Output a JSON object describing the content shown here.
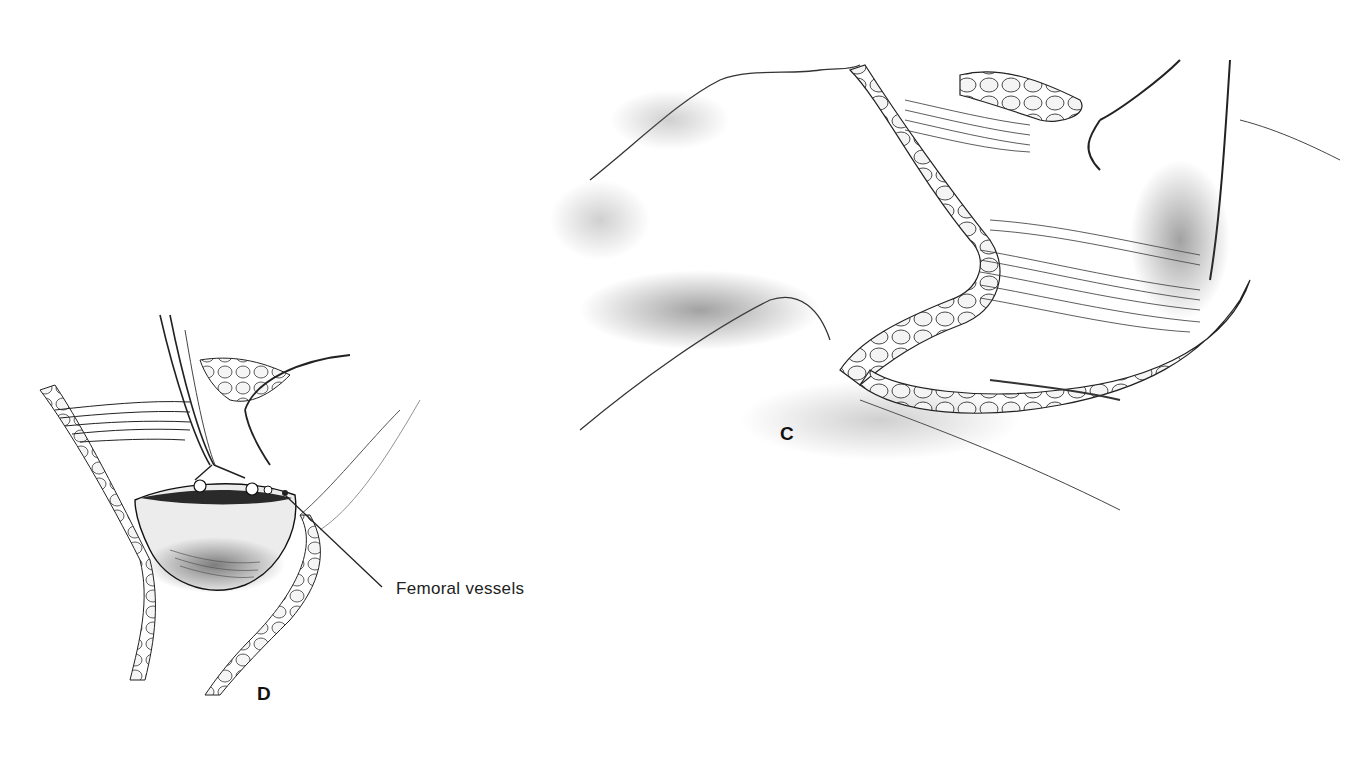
{
  "figure": {
    "panels": [
      {
        "id": "C",
        "label": "C",
        "description": "Surgical exposure of thigh/groin region with retractors, showing muscle fibers and fatty tissue"
      },
      {
        "id": "D",
        "label": "D",
        "description": "Close-up of opened wound with forceps/retractors exposing femoral vessels"
      }
    ],
    "callouts": [
      {
        "panel": "D",
        "text": "Femoral vessels"
      }
    ],
    "colors": {
      "background": "#ffffff",
      "ink": "#1a1a1a",
      "shading": "#6b6b6b"
    }
  }
}
